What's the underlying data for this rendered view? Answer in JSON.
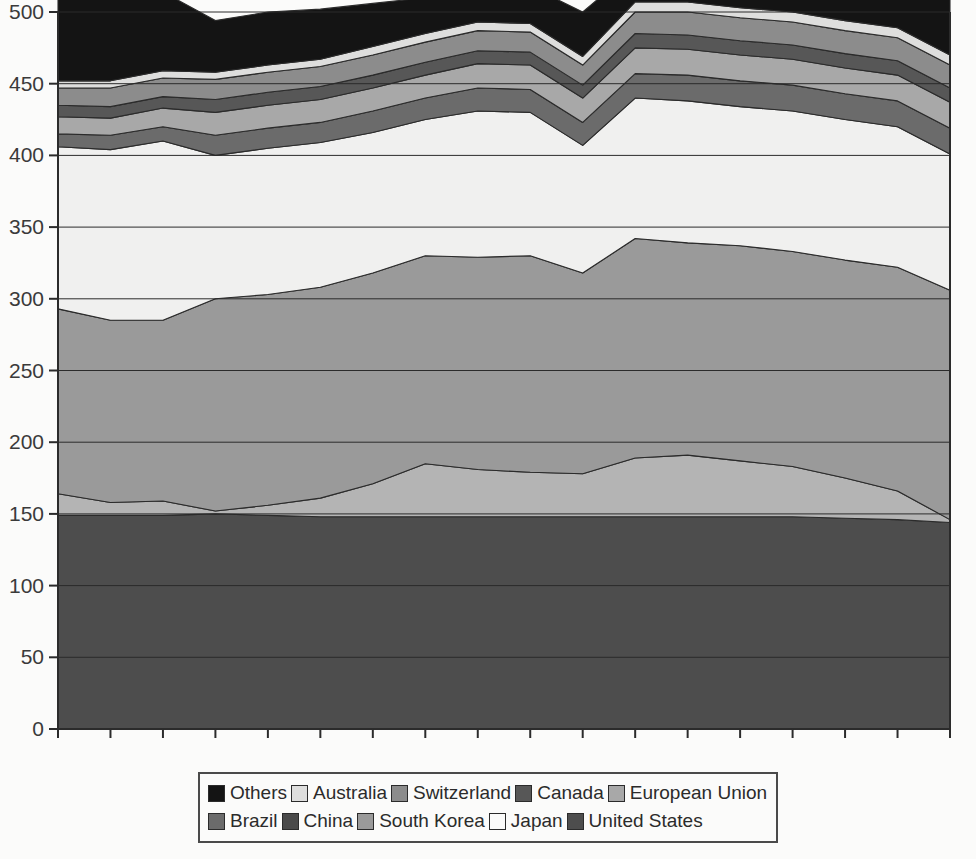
{
  "chart_data": {
    "type": "area",
    "stacked": true,
    "title": "",
    "xlabel": "",
    "ylabel": "",
    "ylim": [
      0,
      500
    ],
    "yticks": [
      0,
      50,
      100,
      150,
      200,
      250,
      300,
      350,
      400,
      450,
      500
    ],
    "grid": true,
    "legend_position": "bottom",
    "categories": [
      "1990",
      "1991",
      "1993",
      "1994",
      "1995",
      "1996",
      "1997",
      "1998",
      "1999",
      "2000",
      "2001",
      "2002",
      "2003",
      "2004",
      "2005",
      "2006",
      "2007",
      "2008"
    ],
    "series": [
      {
        "name": "United States",
        "color": "#4d4d4d",
        "values": [
          149,
          149,
          149,
          150,
          149,
          148,
          148,
          148,
          148,
          148,
          148,
          148,
          148,
          148,
          148,
          147,
          146,
          144
        ]
      },
      {
        "name": "Japan",
        "color": "#b4b4b4",
        "values": [
          15,
          9,
          10,
          2,
          7,
          13,
          23,
          37,
          33,
          31,
          30,
          41,
          43,
          39,
          35,
          28,
          20,
          2
        ]
      },
      {
        "name": "South Korea",
        "color": "#9a9a9a",
        "values": [
          129,
          127,
          126,
          148,
          147,
          147,
          147,
          145,
          148,
          151,
          140,
          153,
          148,
          150,
          150,
          152,
          156,
          160
        ]
      },
      {
        "name": "China",
        "color": "#f0f0ef",
        "values": [
          113,
          119,
          125,
          100,
          102,
          101,
          98,
          95,
          102,
          100,
          89,
          98,
          99,
          97,
          98,
          98,
          98,
          95
        ]
      },
      {
        "name": "Brazil",
        "color": "#6b6b6b",
        "values": [
          9,
          10,
          10,
          14,
          14,
          14,
          15,
          15,
          16,
          16,
          16,
          17,
          18,
          18,
          18,
          18,
          18,
          18
        ]
      },
      {
        "name": "European Union",
        "color": "#a8a8a8",
        "values": [
          12,
          12,
          13,
          16,
          16,
          16,
          16,
          16,
          17,
          17,
          17,
          18,
          18,
          18,
          18,
          18,
          18,
          18
        ]
      },
      {
        "name": "Canada",
        "color": "#575757",
        "values": [
          8,
          8,
          8,
          9,
          9,
          9,
          9,
          9,
          9,
          9,
          9,
          10,
          10,
          10,
          10,
          10,
          10,
          10
        ]
      },
      {
        "name": "Switzerland",
        "color": "#8c8c8c",
        "values": [
          12,
          13,
          13,
          14,
          14,
          14,
          14,
          14,
          14,
          14,
          14,
          15,
          16,
          16,
          16,
          16,
          16,
          16
        ]
      },
      {
        "name": "Australia",
        "color": "#dededd",
        "values": [
          5,
          5,
          5,
          5,
          5,
          5,
          6,
          6,
          6,
          6,
          6,
          7,
          7,
          7,
          7,
          7,
          7,
          7
        ]
      },
      {
        "name": "Others",
        "color": "#141414",
        "values": [
          58,
          57,
          55,
          36,
          37,
          35,
          30,
          25,
          24,
          26,
          31,
          24,
          22,
          26,
          30,
          36,
          43,
          51
        ]
      }
    ]
  },
  "legend": {
    "rows": [
      [
        {
          "label": "Others",
          "color": "#141414"
        },
        {
          "label": "Australia",
          "color": "#dededd"
        },
        {
          "label": "Switzerland",
          "color": "#8c8c8c"
        },
        {
          "label": "Canada",
          "color": "#575757"
        },
        {
          "label": "European Union",
          "color": "#a8a8a8"
        }
      ],
      [
        {
          "label": "Brazil",
          "color": "#6b6b6b"
        },
        {
          "label": "China",
          "color": "#4a4a4a"
        },
        {
          "label": "South Korea",
          "color": "#9a9a9a"
        },
        {
          "label": "Japan",
          "color": "#fbfbfa"
        },
        {
          "label": "United States",
          "color": "#4d4d4d"
        }
      ]
    ]
  }
}
